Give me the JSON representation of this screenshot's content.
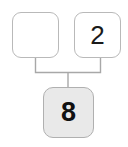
{
  "diagram": {
    "type": "number-bond-tree",
    "background_color": "#ffffff",
    "nodes": [
      {
        "id": "top-left",
        "label": "",
        "fill": "#ffffff",
        "border": "#b9b9b9",
        "role": "empty-part"
      },
      {
        "id": "top-right",
        "label": "2",
        "fill": "#ffffff",
        "border": "#b9b9b9",
        "role": "part"
      },
      {
        "id": "bottom",
        "label": "8",
        "fill": "#e9e9e9",
        "border": "#b0b0b0",
        "role": "whole"
      }
    ],
    "connector_color": "#a8a8a8",
    "edges": [
      {
        "from": "top-left",
        "to": "bottom"
      },
      {
        "from": "top-right",
        "to": "bottom"
      }
    ]
  }
}
